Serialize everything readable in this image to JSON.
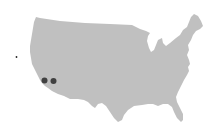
{
  "map": {
    "region": "Contiguous United States",
    "land_color": "#c0c0c0",
    "background_color": "#ffffff",
    "marker_color": "#404040",
    "markers": [
      {
        "name": "marker-southern-california-west",
        "location": "Southern California (coastal)",
        "size": "large"
      },
      {
        "name": "marker-southern-california-east",
        "location": "Southern California (inland)",
        "size": "large"
      },
      {
        "name": "marker-offshore-pacific",
        "location": "Pacific Ocean, west of California",
        "size": "small"
      }
    ]
  }
}
